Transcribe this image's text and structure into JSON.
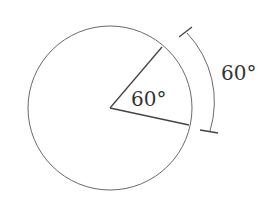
{
  "diagram": {
    "type": "circle-central-angle",
    "colors": {
      "background": "#ffffff",
      "stroke": "#555555",
      "radius_stroke": "#444444",
      "text": "#333333"
    },
    "circle": {
      "cx": 110,
      "cy": 108,
      "r": 82
    },
    "central_angle": {
      "label": "60°",
      "value_degrees": 60
    },
    "arc_measure": {
      "label": "60°",
      "value_degrees": 60
    }
  }
}
